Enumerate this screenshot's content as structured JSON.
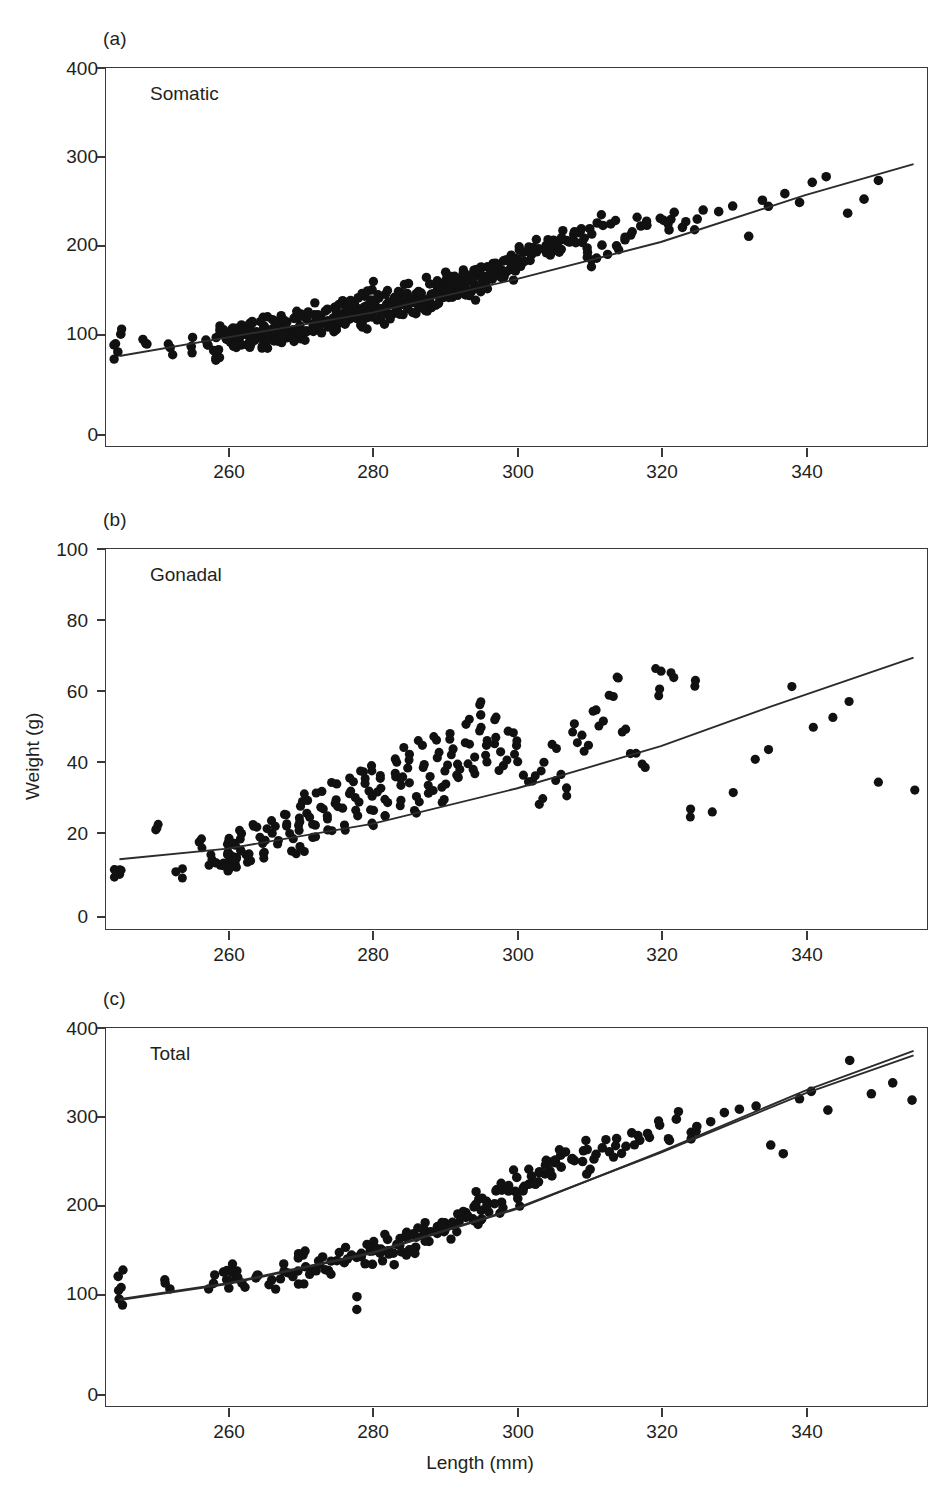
{
  "figure": {
    "axis_title_x": "Length (mm)",
    "axis_title_y": "Weight (g)",
    "point_color": "#111111",
    "line_color": "#2b2b2b",
    "frame_color": "#3a3a3a"
  },
  "chart_data": [
    {
      "type": "scatter",
      "panel_tag": "(a)",
      "title": "Somatic",
      "xlabel": "Length (mm)",
      "ylabel": "Weight (g)",
      "xlim": [
        243,
        357
      ],
      "ylim": [
        0,
        430
      ],
      "xticks": [
        260,
        280,
        300,
        320,
        340
      ],
      "yticks": [
        0,
        100,
        200,
        300,
        400
      ],
      "grid": false,
      "legend": "none",
      "fit": {
        "kind": "linear",
        "note": "least-squares line through cloud",
        "points": [
          [
            245,
            103
          ],
          [
            260,
            124
          ],
          [
            280,
            152
          ],
          [
            300,
            190
          ],
          [
            320,
            232
          ],
          [
            340,
            285
          ],
          [
            355,
            320
          ]
        ]
      },
      "x": [
        245,
        245,
        249,
        252,
        255,
        257,
        258,
        259,
        259,
        260,
        260,
        260,
        260,
        261,
        261,
        261,
        261,
        262,
        262,
        262,
        263,
        263,
        263,
        264,
        264,
        265,
        265,
        265,
        266,
        266,
        266,
        267,
        267,
        267,
        268,
        268,
        268,
        268,
        269,
        269,
        269,
        269,
        270,
        270,
        270,
        270,
        271,
        271,
        271,
        271,
        272,
        272,
        272,
        272,
        273,
        273,
        273,
        273,
        274,
        274,
        274,
        274,
        275,
        275,
        275,
        275,
        276,
        276,
        276,
        276,
        277,
        277,
        277,
        277,
        278,
        278,
        278,
        278,
        279,
        279,
        279,
        279,
        280,
        280,
        280,
        280,
        280,
        281,
        281,
        281,
        281,
        282,
        282,
        282,
        282,
        283,
        283,
        283,
        283,
        284,
        284,
        284,
        284,
        285,
        285,
        285,
        285,
        285,
        286,
        286,
        286,
        286,
        287,
        287,
        287,
        287,
        288,
        288,
        288,
        288,
        289,
        289,
        289,
        289,
        290,
        290,
        290,
        290,
        290,
        291,
        291,
        291,
        291,
        292,
        292,
        292,
        292,
        293,
        293,
        293,
        293,
        294,
        294,
        294,
        294,
        295,
        295,
        295,
        295,
        296,
        296,
        296,
        296,
        297,
        297,
        297,
        298,
        298,
        298,
        299,
        299,
        299,
        300,
        300,
        300,
        301,
        301,
        302,
        302,
        303,
        303,
        304,
        304,
        305,
        305,
        306,
        306,
        307,
        307,
        308,
        308,
        309,
        309,
        310,
        310,
        310,
        311,
        311,
        312,
        312,
        313,
        314,
        315,
        316,
        317,
        318,
        320,
        321,
        322,
        323,
        325,
        326,
        328,
        330,
        332,
        334,
        335,
        337,
        339,
        341,
        343,
        346,
        348,
        350,
        355
      ],
      "y": [
        103,
        125,
        113,
        110,
        118,
        120,
        112,
        103,
        128,
        122,
        130,
        127,
        118,
        132,
        126,
        120,
        114,
        131,
        124,
        119,
        129,
        122,
        136,
        130,
        124,
        128,
        135,
        121,
        133,
        127,
        140,
        134,
        128,
        122,
        138,
        131,
        126,
        145,
        136,
        130,
        124,
        142,
        139,
        133,
        127,
        148,
        141,
        135,
        129,
        146,
        143,
        137,
        131,
        152,
        145,
        139,
        133,
        150,
        147,
        141,
        135,
        155,
        149,
        143,
        137,
        158,
        151,
        145,
        139,
        161,
        154,
        148,
        142,
        164,
        157,
        150,
        144,
        167,
        160,
        153,
        147,
        170,
        163,
        156,
        150,
        144,
        180,
        166,
        159,
        152,
        146,
        169,
        162,
        155,
        149,
        172,
        165,
        158,
        152,
        175,
        168,
        161,
        154,
        178,
        171,
        164,
        157,
        188,
        174,
        167,
        160,
        153,
        177,
        170,
        163,
        156,
        180,
        173,
        166,
        159,
        183,
        176,
        169,
        162,
        186,
        179,
        172,
        165,
        200,
        189,
        182,
        175,
        168,
        192,
        185,
        178,
        171,
        195,
        188,
        181,
        174,
        198,
        191,
        184,
        177,
        201,
        194,
        187,
        180,
        204,
        197,
        190,
        183,
        207,
        200,
        193,
        210,
        203,
        196,
        213,
        206,
        199,
        216,
        209,
        202,
        219,
        212,
        222,
        215,
        225,
        218,
        228,
        221,
        231,
        224,
        234,
        227,
        237,
        230,
        240,
        233,
        243,
        236,
        246,
        228,
        212,
        249,
        218,
        252,
        224,
        255,
        230,
        236,
        242,
        248,
        254,
        260,
        246,
        266,
        252,
        258,
        264,
        270,
        276,
        238,
        282,
        268,
        290,
        274,
        296,
        302,
        268,
        280,
        303
      ],
      "n_points": 250
    },
    {
      "type": "scatter",
      "panel_tag": "(b)",
      "title": "Gonadal",
      "xlabel": "Length (mm)",
      "ylabel": "Weight (g)",
      "xlim": [
        243,
        357
      ],
      "ylim": [
        0,
        108
      ],
      "xticks": [
        260,
        280,
        300,
        320,
        340
      ],
      "yticks": [
        0,
        20,
        40,
        60,
        80,
        100
      ],
      "grid": false,
      "legend": "none",
      "fit": {
        "kind": "power",
        "note": "curved allometric fit",
        "points": [
          [
            245,
            20
          ],
          [
            260,
            23
          ],
          [
            280,
            30
          ],
          [
            300,
            40
          ],
          [
            310,
            46
          ],
          [
            320,
            52
          ],
          [
            335,
            63
          ],
          [
            345,
            70
          ],
          [
            355,
            77
          ]
        ]
      },
      "x": [
        245,
        245,
        250,
        253,
        256,
        258,
        259,
        260,
        260,
        260,
        260,
        261,
        261,
        261,
        262,
        262,
        263,
        264,
        265,
        265,
        266,
        266,
        267,
        268,
        268,
        269,
        269,
        270,
        270,
        270,
        270,
        271,
        271,
        272,
        272,
        273,
        273,
        274,
        274,
        275,
        275,
        276,
        276,
        277,
        277,
        278,
        278,
        279,
        279,
        280,
        280,
        280,
        280,
        281,
        281,
        282,
        282,
        283,
        283,
        284,
        284,
        285,
        285,
        285,
        286,
        286,
        287,
        287,
        288,
        288,
        289,
        289,
        290,
        290,
        290,
        291,
        291,
        292,
        292,
        293,
        293,
        294,
        294,
        295,
        295,
        295,
        296,
        296,
        297,
        297,
        298,
        298,
        299,
        300,
        300,
        301,
        302,
        303,
        304,
        305,
        306,
        307,
        308,
        309,
        310,
        311,
        312,
        313,
        314,
        315,
        316,
        318,
        320,
        320,
        322,
        324,
        325,
        327,
        330,
        333,
        335,
        338,
        341,
        344,
        346,
        350,
        355
      ],
      "y": [
        17,
        16,
        28,
        16,
        25,
        20,
        18,
        26,
        22,
        19,
        17,
        24,
        21,
        18,
        27,
        23,
        20,
        29,
        25,
        22,
        31,
        27,
        24,
        33,
        29,
        26,
        22,
        35,
        31,
        28,
        24,
        37,
        33,
        30,
        26,
        39,
        35,
        32,
        28,
        41,
        37,
        34,
        30,
        43,
        39,
        36,
        32,
        45,
        41,
        38,
        34,
        30,
        46,
        43,
        40,
        36,
        32,
        48,
        44,
        41,
        37,
        50,
        46,
        42,
        38,
        34,
        52,
        47,
        43,
        39,
        54,
        49,
        45,
        41,
        37,
        56,
        51,
        47,
        43,
        58,
        53,
        49,
        45,
        64,
        61,
        57,
        52,
        48,
        59,
        54,
        50,
        46,
        56,
        52,
        48,
        44,
        42,
        36,
        47,
        52,
        44,
        40,
        58,
        55,
        52,
        62,
        59,
        66,
        71,
        57,
        50,
        46,
        73,
        68,
        71,
        34,
        71,
        33,
        39,
        48,
        51,
        69,
        57,
        60,
        65,
        42,
        40
      ],
      "n_points": 200
    },
    {
      "type": "scatter",
      "panel_tag": "(c)",
      "title": "Total",
      "xlabel": "Length (mm)",
      "ylabel": "Weight (g)",
      "xlim": [
        243,
        357
      ],
      "ylim": [
        0,
        430
      ],
      "xticks": [
        260,
        280,
        300,
        320,
        340
      ],
      "yticks": [
        0,
        100,
        200,
        300,
        400
      ],
      "grid": false,
      "legend": "none",
      "fit": {
        "kind": "two-curves",
        "note": "two nearly coincident fits diverging at high length",
        "points_a": [
          [
            245,
            122
          ],
          [
            260,
            140
          ],
          [
            280,
            175
          ],
          [
            300,
            225
          ],
          [
            320,
            288
          ],
          [
            340,
            355
          ],
          [
            355,
            398
          ]
        ],
        "points_b": [
          [
            245,
            121
          ],
          [
            260,
            139
          ],
          [
            280,
            174
          ],
          [
            300,
            224
          ],
          [
            320,
            289
          ],
          [
            340,
            358
          ],
          [
            355,
            403
          ]
        ]
      },
      "x": [
        245,
        245,
        252,
        258,
        260,
        260,
        261,
        262,
        264,
        266,
        268,
        269,
        270,
        270,
        271,
        272,
        273,
        274,
        275,
        276,
        277,
        278,
        278,
        279,
        280,
        280,
        280,
        281,
        281,
        282,
        282,
        283,
        283,
        284,
        284,
        285,
        285,
        285,
        286,
        286,
        287,
        287,
        288,
        288,
        289,
        289,
        290,
        290,
        290,
        291,
        291,
        292,
        292,
        293,
        293,
        294,
        294,
        295,
        295,
        295,
        296,
        296,
        297,
        297,
        298,
        298,
        299,
        299,
        300,
        300,
        300,
        301,
        301,
        302,
        302,
        303,
        303,
        304,
        304,
        305,
        305,
        306,
        306,
        307,
        308,
        309,
        310,
        310,
        311,
        312,
        313,
        314,
        315,
        316,
        317,
        318,
        320,
        321,
        322,
        324,
        325,
        327,
        329,
        331,
        333,
        335,
        337,
        339,
        341,
        343,
        346,
        349,
        352,
        355
      ],
      "y": [
        145,
        122,
        135,
        142,
        152,
        138,
        147,
        141,
        150,
        145,
        156,
        149,
        172,
        143,
        160,
        154,
        166,
        158,
        170,
        163,
        176,
        168,
        122,
        162,
        182,
        174,
        166,
        178,
        170,
        188,
        180,
        172,
        164,
        184,
        176,
        196,
        188,
        180,
        192,
        184,
        202,
        194,
        198,
        190,
        208,
        200,
        212,
        204,
        196,
        210,
        202,
        218,
        208,
        222,
        214,
        226,
        216,
        232,
        224,
        216,
        236,
        228,
        240,
        230,
        246,
        236,
        250,
        242,
        258,
        248,
        238,
        254,
        244,
        264,
        252,
        268,
        258,
        272,
        262,
        278,
        266,
        284,
        272,
        288,
        276,
        282,
        292,
        272,
        286,
        296,
        290,
        302,
        296,
        308,
        300,
        314,
        320,
        306,
        326,
        312,
        318,
        324,
        330,
        336,
        342,
        300,
        290,
        348,
        356,
        340,
        390,
        358,
        370,
        344
      ],
      "n_points": 230
    }
  ]
}
